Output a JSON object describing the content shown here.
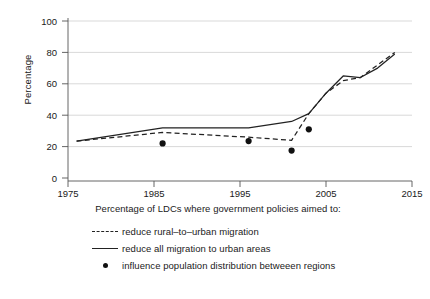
{
  "chart_data": {
    "type": "line",
    "title": "",
    "xlabel": "",
    "ylabel": "Percentage",
    "xlim": [
      1975,
      2015
    ],
    "ylim": [
      0,
      100
    ],
    "xticks": [
      1975,
      1985,
      1995,
      2005,
      2015
    ],
    "yticks": [
      0,
      20,
      40,
      60,
      80,
      100
    ],
    "grid": "horizontal",
    "legend_position": "below-plot",
    "legend_title": "Percentage of LDCs where government policies aimed to:",
    "series": [
      {
        "name": "reduce rural–to–urban migration",
        "style": "dashed",
        "color": "#222222",
        "x": [
          1976,
          1986,
          1996,
          2001,
          2003,
          2005,
          2007,
          2009,
          2011,
          2013
        ],
        "values": [
          23.5,
          29,
          26,
          24,
          41,
          54,
          62,
          64,
          72,
          80
        ]
      },
      {
        "name": "reduce all migration to urban areas",
        "style": "solid",
        "color": "#222222",
        "x": [
          1976,
          1986,
          1996,
          2001,
          2003,
          2005,
          2007,
          2009,
          2011,
          2013
        ],
        "values": [
          23.5,
          32,
          32,
          36,
          41,
          54,
          65,
          64,
          70,
          79
        ]
      },
      {
        "name": "influence population distribution betweeen regions",
        "style": "points",
        "color": "#111111",
        "x": [
          1986,
          1996,
          2001,
          2003
        ],
        "values": [
          22,
          23.5,
          17.5,
          31
        ]
      }
    ]
  },
  "legend": {
    "title": "Percentage of LDCs where government policies aimed to:",
    "items": [
      {
        "key": "dashed-line-key",
        "label": "reduce rural–to–urban migration"
      },
      {
        "key": "solid-line-key",
        "label": "reduce all migration to urban areas"
      },
      {
        "key": "dot-marker-key",
        "label": "influence population distribution betweeen regions"
      }
    ]
  },
  "axes": {
    "y_title": "Percentage",
    "y_tick_labels": [
      "100",
      "80",
      "60",
      "40",
      "20",
      "0"
    ],
    "x_tick_labels": [
      "1975",
      "1985",
      "1995",
      "2005",
      "2015"
    ]
  },
  "colors": {
    "line": "#222222",
    "marker": "#111111",
    "grid": "#c9c9c9",
    "axis": "#555555",
    "text": "#1a1a1a",
    "background": "#ffffff"
  }
}
